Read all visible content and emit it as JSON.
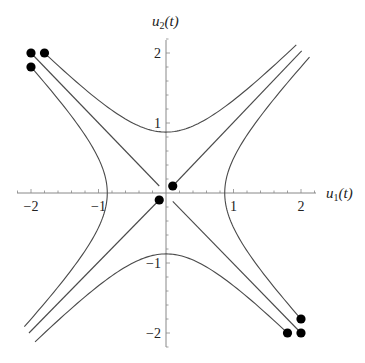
{
  "chart_data": {
    "type": "line",
    "title": "",
    "xlabel": "u1(t)",
    "ylabel": "u2(t)",
    "xlim": [
      -2.2,
      2.2
    ],
    "ylim": [
      -2.2,
      2.2
    ],
    "grid": false,
    "legend": null,
    "x_ticks": [
      -2,
      -1,
      1,
      2
    ],
    "y_ticks": [
      -2,
      -1,
      1,
      2
    ],
    "x_tick_labels": [
      "−2",
      "−1",
      "1",
      "2"
    ],
    "y_tick_labels": [
      "−2",
      "−1",
      "1",
      "2"
    ],
    "minor_ticks_per_unit": 5,
    "series": [
      {
        "name": "upper-hyperbola",
        "kind": "hyperbola_v",
        "a": 0.87,
        "sign": 1,
        "from": [
          -1.8,
          2.0
        ],
        "to": [
          1.93,
          2.11
        ]
      },
      {
        "name": "lower-hyperbola",
        "kind": "hyperbola_v",
        "a": 0.87,
        "sign": -1,
        "from": [
          1.8,
          -2.0
        ],
        "to": [
          -1.94,
          -2.1
        ]
      },
      {
        "name": "left-hyperbola",
        "kind": "hyperbola_h",
        "a": 0.87,
        "sign": -1,
        "from": [
          -2.0,
          1.8
        ],
        "to": [
          -2.12,
          -1.91
        ]
      },
      {
        "name": "right-hyperbola",
        "kind": "hyperbola_h",
        "a": 0.87,
        "sign": 1,
        "from": [
          2.0,
          -1.8
        ],
        "to": [
          2.12,
          1.94
        ]
      },
      {
        "name": "stable-line-upper-left",
        "kind": "line",
        "from": [
          -2.0,
          2.0
        ],
        "to": [
          -0.1,
          0.1
        ]
      },
      {
        "name": "stable-line-lower-right",
        "kind": "line",
        "from": [
          2.0,
          -2.0
        ],
        "to": [
          0.1,
          -0.12
        ]
      },
      {
        "name": "unstable-line-upper-right",
        "kind": "line",
        "from": [
          0.1,
          0.1
        ],
        "to": [
          2.01,
          2.03
        ]
      },
      {
        "name": "unstable-line-lower-left",
        "kind": "line",
        "from": [
          -0.1,
          -0.1
        ],
        "to": [
          -2.03,
          -2.0
        ]
      }
    ],
    "points": [
      [
        -2.0,
        2.0
      ],
      [
        -1.8,
        2.0
      ],
      [
        -2.0,
        1.8
      ],
      [
        2.0,
        -2.0
      ],
      [
        1.8,
        -2.0
      ],
      [
        2.0,
        -1.8
      ],
      [
        0.1,
        0.1
      ],
      [
        -0.1,
        -0.1
      ]
    ]
  },
  "labels": {
    "x_axis_main": "u",
    "x_axis_sub": "1",
    "x_axis_suffix": "(t)",
    "y_axis_main": "u",
    "y_axis_sub": "2",
    "y_axis_suffix": "(t)"
  }
}
